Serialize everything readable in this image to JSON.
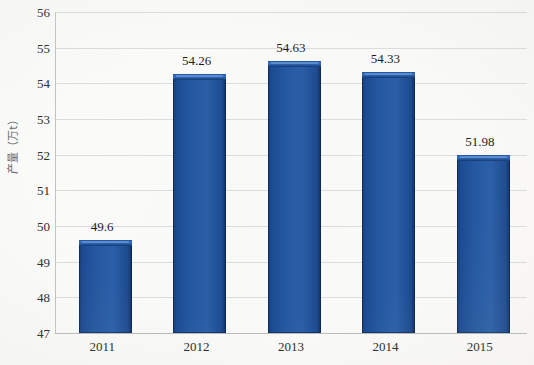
{
  "chart_data": {
    "type": "bar",
    "title": "",
    "xlabel": "",
    "ylabel": "产量（万t）",
    "categories": [
      "2011",
      "2012",
      "2013",
      "2014",
      "2015"
    ],
    "values": [
      49.6,
      54.26,
      54.63,
      54.33,
      51.98
    ],
    "value_labels": [
      "49.6",
      "54.26",
      "54.63",
      "54.33",
      "51.98"
    ],
    "ylim": [
      47,
      56
    ],
    "y_ticks": [
      56,
      55,
      54,
      53,
      52,
      51,
      50,
      49,
      48,
      47
    ],
    "y_tick_labels": [
      "56",
      "55",
      "54",
      "53",
      "52",
      "51",
      "50",
      "49",
      "48",
      "47"
    ],
    "grid": "horizontal",
    "legend": "none",
    "series": [
      {
        "name": "产量",
        "values": [
          49.6,
          54.26,
          54.63,
          54.33,
          51.98
        ]
      }
    ]
  },
  "colors": {
    "bar_fill": "#24579f",
    "bar_highlight": "#3a74c4",
    "bar_edge": "#102e5e",
    "gridline": "#dcdcdc",
    "axis_line": "#b9b9b9",
    "background": "#fbfbfa",
    "text": "#2b2b2b"
  }
}
